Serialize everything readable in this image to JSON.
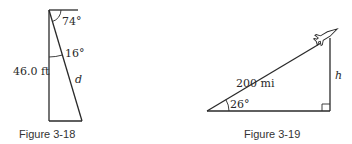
{
  "figures": [
    {
      "caption": "Figure 3-18",
      "labels": {
        "top_angle": "74°",
        "inner_angle": "16°",
        "vertical_side": "46.0 ft",
        "hypotenuse": "d"
      }
    },
    {
      "caption": "Figure 3-19",
      "labels": {
        "hypotenuse": "200 mi",
        "base_angle": "26°",
        "vertical_side": "h"
      },
      "icons": [
        "airplane-icon",
        "right-angle-marker"
      ]
    }
  ]
}
